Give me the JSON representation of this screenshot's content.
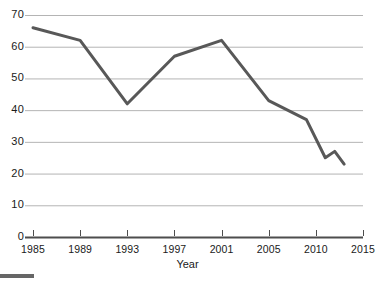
{
  "chart_data": {
    "type": "line",
    "title": "",
    "subtitle": "",
    "xlabel": "Year",
    "ylabel": "",
    "grid": true,
    "legend": false,
    "line_color": "#585858",
    "grid_color": "#b4b4b4",
    "axis_color": "#4d4d4d",
    "background": "#ffffff",
    "xlim": [
      1985,
      2015
    ],
    "ylim": [
      0,
      70
    ],
    "ytick_labels": [
      "0",
      "10",
      "20",
      "30",
      "40",
      "50",
      "60",
      "70"
    ],
    "ytick_values": [
      0,
      10,
      20,
      30,
      40,
      50,
      60,
      70
    ],
    "xtick_labels": [
      "1985",
      "1989",
      "1993",
      "1997",
      "2001",
      "2005",
      "2010",
      "2015"
    ],
    "xtick_values": [
      1985,
      1989,
      1993,
      1997,
      2001,
      2005,
      2010,
      2015
    ],
    "x": [
      1985,
      1989,
      1993,
      1997,
      2001,
      2005,
      2009,
      2011,
      2012,
      2013
    ],
    "values": [
      66,
      62,
      42,
      57,
      62,
      43,
      37,
      25,
      27,
      23
    ],
    "series": [
      {
        "name": "series-1",
        "x": [
          1985,
          1989,
          1993,
          1997,
          2001,
          2005,
          2009,
          2011,
          2012,
          2013
        ],
        "values": [
          66,
          62,
          42,
          57,
          62,
          43,
          37,
          25,
          27,
          23
        ]
      }
    ]
  },
  "axes": {
    "x_title": "Year"
  }
}
